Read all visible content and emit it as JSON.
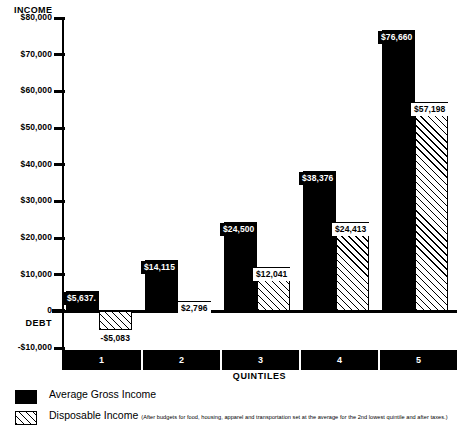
{
  "chart_data": {
    "type": "bar",
    "title": "",
    "ylabel": "INCOME",
    "xlabel": "QUINTILES",
    "categories": [
      "1",
      "2",
      "3",
      "4",
      "5"
    ],
    "ylim": [
      -10000,
      80000
    ],
    "yticks": [
      -10000,
      0,
      10000,
      20000,
      30000,
      40000,
      50000,
      60000,
      70000,
      80000
    ],
    "ytick_labels": [
      "-$10,000",
      "0",
      "$10,000",
      "$20,000",
      "$30,000",
      "$40,000",
      "$50,000",
      "$60,000",
      "$70,000",
      "$80,000"
    ],
    "zero_axis_label": "DEBT",
    "grid": false,
    "legend_position": "below",
    "series": [
      {
        "name": "Average Gross Income",
        "style": "solid-black",
        "values": [
          5637,
          14115,
          24500,
          38376,
          76660
        ],
        "labels": [
          "$5,637.",
          "$14,115",
          "$24,500",
          "$38,376",
          "$76,660"
        ]
      },
      {
        "name": "Disposable Income",
        "style": "diagonal-hatch",
        "values": [
          -5083,
          2796,
          12041,
          24413,
          57198
        ],
        "labels": [
          "-$5,083",
          "$2,796",
          "$12,041",
          "$24,413",
          "$57,198"
        ]
      }
    ]
  },
  "axes": {
    "y_title": "INCOME",
    "x_title": "QUINTILES",
    "zero_label": "0",
    "debt_label": "DEBT",
    "tick_labels": [
      "$80,000",
      "$70,000",
      "$60,000",
      "$50,000",
      "$40,000",
      "$30,000",
      "$20,000",
      "$10,000",
      "0",
      "-$10,000"
    ]
  },
  "legend": {
    "items": [
      {
        "swatch": "solid-black",
        "label": "Average Gross Income",
        "note": ""
      },
      {
        "swatch": "diagonal-hatch",
        "label": "Disposable Income",
        "note": "(After budgets for food, housing, apparel and transportation set at the average for the 2nd lowest quintile and after taxes.)"
      }
    ]
  },
  "colors": {
    "gross_income": "#000000",
    "disposable_income_line": "#000000",
    "background": "#ffffff",
    "axis": "#000000"
  },
  "corner_artifact": ""
}
